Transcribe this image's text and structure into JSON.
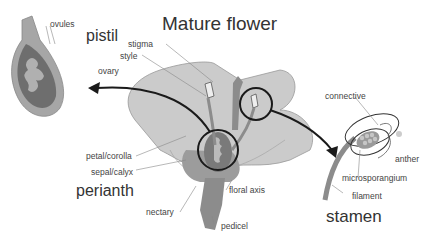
{
  "title": "Mature flower",
  "sections": {
    "pistil": "pistil",
    "perianth": "perianth",
    "stamen": "stamen"
  },
  "labels": {
    "ovules": "ovules",
    "stigma": "stigma",
    "style": "style",
    "ovary": "ovary",
    "petal_corolla": "petal/corolla",
    "sepal_calyx": "sepal/calyx",
    "nectary": "nectary",
    "floral_axis": "floral axis",
    "pedicel": "pedicel",
    "connective": "connective",
    "anther": "anther",
    "microsporangium": "microsporangium",
    "filament": "filament"
  },
  "colors": {
    "petal": "#c8c8c8",
    "petal_dark": "#a8a8a8",
    "organ": "#8c8c8c",
    "ovary_inner": "#6e6e6e",
    "ovule": "#b0b0b0",
    "outline": "#1a1a1a",
    "leader": "#888888"
  }
}
